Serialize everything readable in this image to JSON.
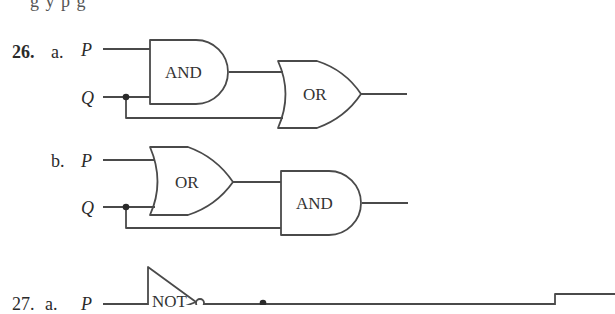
{
  "header": {
    "cut_off_text": "g  y  p                 g"
  },
  "problems": [
    {
      "number": "26.",
      "parts": [
        {
          "label": "a.",
          "inputs": [
            "P",
            "Q"
          ],
          "gates": [
            {
              "type": "AND",
              "label": "AND",
              "inputs": [
                "P",
                "Q"
              ]
            },
            {
              "type": "OR",
              "label": "OR",
              "inputs": [
                "AND output",
                "Q"
              ]
            }
          ]
        },
        {
          "label": "b.",
          "inputs": [
            "P",
            "Q"
          ],
          "gates": [
            {
              "type": "OR",
              "label": "OR",
              "inputs": [
                "P",
                "Q"
              ]
            },
            {
              "type": "AND",
              "label": "AND",
              "inputs": [
                "OR output",
                "Q"
              ]
            }
          ]
        }
      ]
    },
    {
      "number": "27.",
      "parts": [
        {
          "label": "a.",
          "inputs": [
            "P"
          ],
          "gates": [
            {
              "type": "NOT",
              "label": "NOT",
              "inputs": [
                "P"
              ]
            }
          ]
        }
      ]
    }
  ],
  "colors": {
    "line": "#4a4a4a",
    "text": "#2a2a2a",
    "background": "#ffffff"
  }
}
